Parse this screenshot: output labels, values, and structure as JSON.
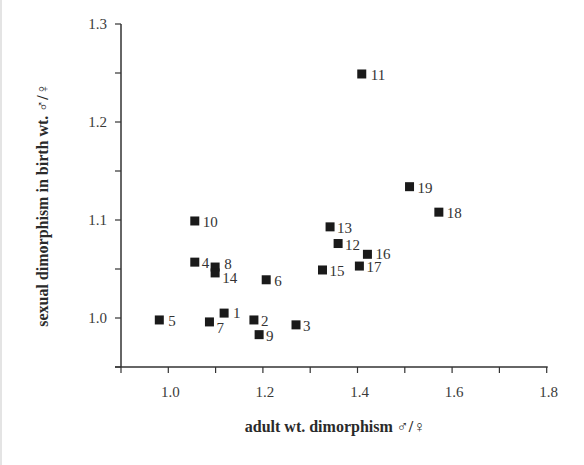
{
  "chart_data": {
    "type": "scatter",
    "title": "",
    "xlabel": "adult wt. dimorphism ♂/♀",
    "ylabel": "sexual dimorphism in birth wt. ♂/♀",
    "xlim": [
      0.9,
      1.8
    ],
    "ylim": [
      0.95,
      1.3
    ],
    "x_ticks": [
      1.0,
      1.2,
      1.4,
      1.6,
      1.8
    ],
    "x_tick_labels": [
      "1.0",
      "1.2",
      "1.4",
      "1.6",
      "1.8"
    ],
    "x_minor_ticks": [
      0.9,
      1.1,
      1.3,
      1.5,
      1.7
    ],
    "y_ticks": [
      1.0,
      1.1,
      1.2,
      1.3
    ],
    "y_tick_labels": [
      "1.0",
      "1.1",
      "1.2",
      "1.3"
    ],
    "y_minor_ticks": [
      0.95,
      1.05,
      1.15,
      1.25
    ],
    "grid": false,
    "legend": null,
    "marker": "square",
    "marker_color": "#1a1a1a",
    "points": [
      {
        "label": "1",
        "x": 1.118,
        "y": 1.005,
        "lx": 9,
        "ly": 5
      },
      {
        "label": "2",
        "x": 1.181,
        "y": 0.998,
        "lx": 7,
        "ly": 6
      },
      {
        "label": "3",
        "x": 1.27,
        "y": 0.993,
        "lx": 7,
        "ly": 6
      },
      {
        "label": "4",
        "x": 1.056,
        "y": 1.057,
        "lx": 7,
        "ly": 6
      },
      {
        "label": "5",
        "x": 0.981,
        "y": 0.998,
        "lx": 9,
        "ly": 6
      },
      {
        "label": "6",
        "x": 1.207,
        "y": 1.039,
        "lx": 8,
        "ly": 6
      },
      {
        "label": "7",
        "x": 1.087,
        "y": 0.996,
        "lx": 7,
        "ly": 11
      },
      {
        "label": "8",
        "x": 1.099,
        "y": 1.052,
        "lx": 9,
        "ly": 2
      },
      {
        "label": "9",
        "x": 1.192,
        "y": 0.983,
        "lx": 7,
        "ly": 6
      },
      {
        "label": "10",
        "x": 1.056,
        "y": 1.099,
        "lx": 8,
        "ly": 6
      },
      {
        "label": "11",
        "x": 1.409,
        "y": 1.249,
        "lx": 9,
        "ly": 6
      },
      {
        "label": "12",
        "x": 1.359,
        "y": 1.076,
        "lx": 7,
        "ly": 6
      },
      {
        "label": "13",
        "x": 1.342,
        "y": 1.093,
        "lx": 7,
        "ly": 6
      },
      {
        "label": "14",
        "x": 1.099,
        "y": 1.046,
        "lx": 7,
        "ly": 10
      },
      {
        "label": "15",
        "x": 1.326,
        "y": 1.049,
        "lx": 7,
        "ly": 6
      },
      {
        "label": "16",
        "x": 1.421,
        "y": 1.065,
        "lx": 8,
        "ly": 5
      },
      {
        "label": "17",
        "x": 1.404,
        "y": 1.053,
        "lx": 7,
        "ly": 6
      },
      {
        "label": "18",
        "x": 1.572,
        "y": 1.108,
        "lx": 8,
        "ly": 6
      },
      {
        "label": "19",
        "x": 1.51,
        "y": 1.134,
        "lx": 8,
        "ly": 6
      }
    ]
  },
  "axes": {
    "x_title": "adult wt. dimorphism ♂/♀",
    "y_title": "sexual dimorphism in birth wt. ♂/♀"
  }
}
